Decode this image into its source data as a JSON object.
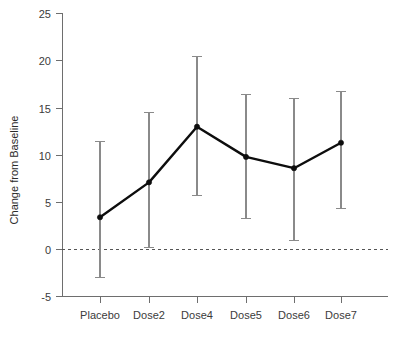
{
  "chart_data": {
    "type": "line",
    "title": "",
    "xlabel": "",
    "ylabel": "Change from Baseline",
    "categories": [
      "Placebo",
      "Dose2",
      "Dose4",
      "Dose5",
      "Dose6",
      "Dose7"
    ],
    "values": [
      3.4,
      7.1,
      13.0,
      9.8,
      8.6,
      11.3
    ],
    "error_low": [
      -3.0,
      0.2,
      5.7,
      3.3,
      0.9,
      4.3
    ],
    "error_high": [
      11.4,
      14.5,
      20.4,
      16.4,
      16.0,
      16.7
    ],
    "ylim": [
      -5,
      25
    ],
    "yticks": [
      -5,
      0,
      5,
      10,
      15,
      20,
      25
    ],
    "ytick_labels": [
      "-5",
      "0",
      "5",
      "10",
      "15",
      "20",
      "25"
    ],
    "xtick_labels": [
      "Placebo",
      "Dose2",
      "Dose4",
      "Dose5",
      "Dose6",
      "Dose7"
    ],
    "grid": false,
    "legend": "none",
    "reference_line": 0,
    "series_color": "#0d0d0d",
    "error_color": "#8a8a8a",
    "axis_color": "#6e6e6e",
    "reference_line_color": "#555555",
    "series_name": "Change from Baseline"
  }
}
